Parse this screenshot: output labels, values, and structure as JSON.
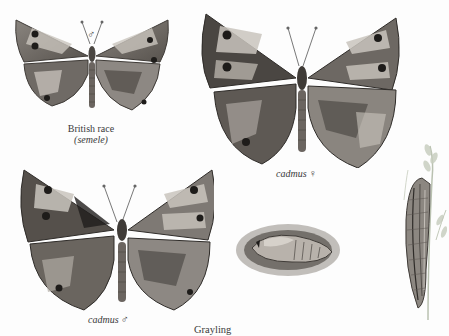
{
  "plate": {
    "title": "Grayling",
    "figures": [
      {
        "id": "british-race-male",
        "caption_line1": "British race",
        "caption_line2": "(semele)",
        "sex_symbol": "♂"
      },
      {
        "id": "cadmus-female",
        "caption": "cadmus",
        "sex_symbol": "♀"
      },
      {
        "id": "cadmus-male",
        "caption": "cadmus",
        "sex_symbol": "♂"
      },
      {
        "id": "pupa",
        "caption": ""
      },
      {
        "id": "larva-on-grass",
        "caption": ""
      }
    ]
  },
  "palette": {
    "wing_dark": "#4a4642",
    "wing_mid": "#7d7873",
    "wing_light": "#c9c4bd",
    "eyespot": "#1e1c1a",
    "background": "#fdfdfd"
  }
}
